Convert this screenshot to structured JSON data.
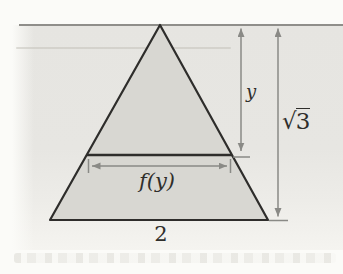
{
  "figure": {
    "labels": {
      "height_partial": "y",
      "section_width": "f(y)",
      "total_height": "√3",
      "total_height_radical": "√",
      "total_height_radicand": "3",
      "base_width": "2"
    },
    "colors": {
      "paper": "#e6e5e1",
      "triangle_fill": "#d8d7d2",
      "outline": "#2e2d2b",
      "measure": "#8a8a86",
      "rule": "#8f8e8a",
      "text": "#2f2e2b"
    }
  }
}
